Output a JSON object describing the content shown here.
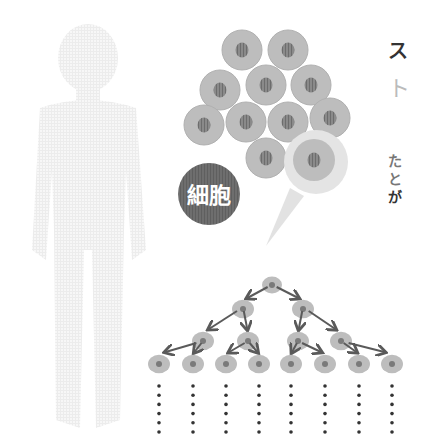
{
  "colors": {
    "background": "#ffffff",
    "silhouette": "#f0f0f0",
    "cell": "#bdbdbd",
    "cell_edge": "#b0b0b0",
    "nucleus": "#7a7a7a",
    "highlight_ring": "#e4e4e4",
    "label_badge": "#6b6b6b",
    "label_text": "#ffffff",
    "arrow": "#5a5a5a",
    "dots": "#333333"
  },
  "label": {
    "text": "細胞"
  },
  "side_text": {
    "line1": "ス",
    "line2": "ト",
    "line3": "た",
    "line4": "と",
    "line5": "が"
  },
  "division_tree": {
    "generations": [
      1,
      2,
      4,
      8
    ],
    "continuation_dots_per_column": 6
  }
}
